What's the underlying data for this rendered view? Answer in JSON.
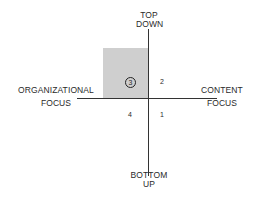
{
  "diagram": {
    "axes": {
      "top": [
        "TOP",
        "DOWN"
      ],
      "bottom": [
        "BOTTOM",
        "UP"
      ],
      "left": [
        "ORGANIZATIONAL",
        "FOCUS"
      ],
      "right": [
        "CONTENT",
        "FOCUS"
      ]
    },
    "quadrants": {
      "top_right": "2",
      "top_left": "3",
      "bottom_left": "4",
      "bottom_right": "1"
    },
    "highlighted_quadrant": "3",
    "highlight_color": "#cfcfcf"
  }
}
